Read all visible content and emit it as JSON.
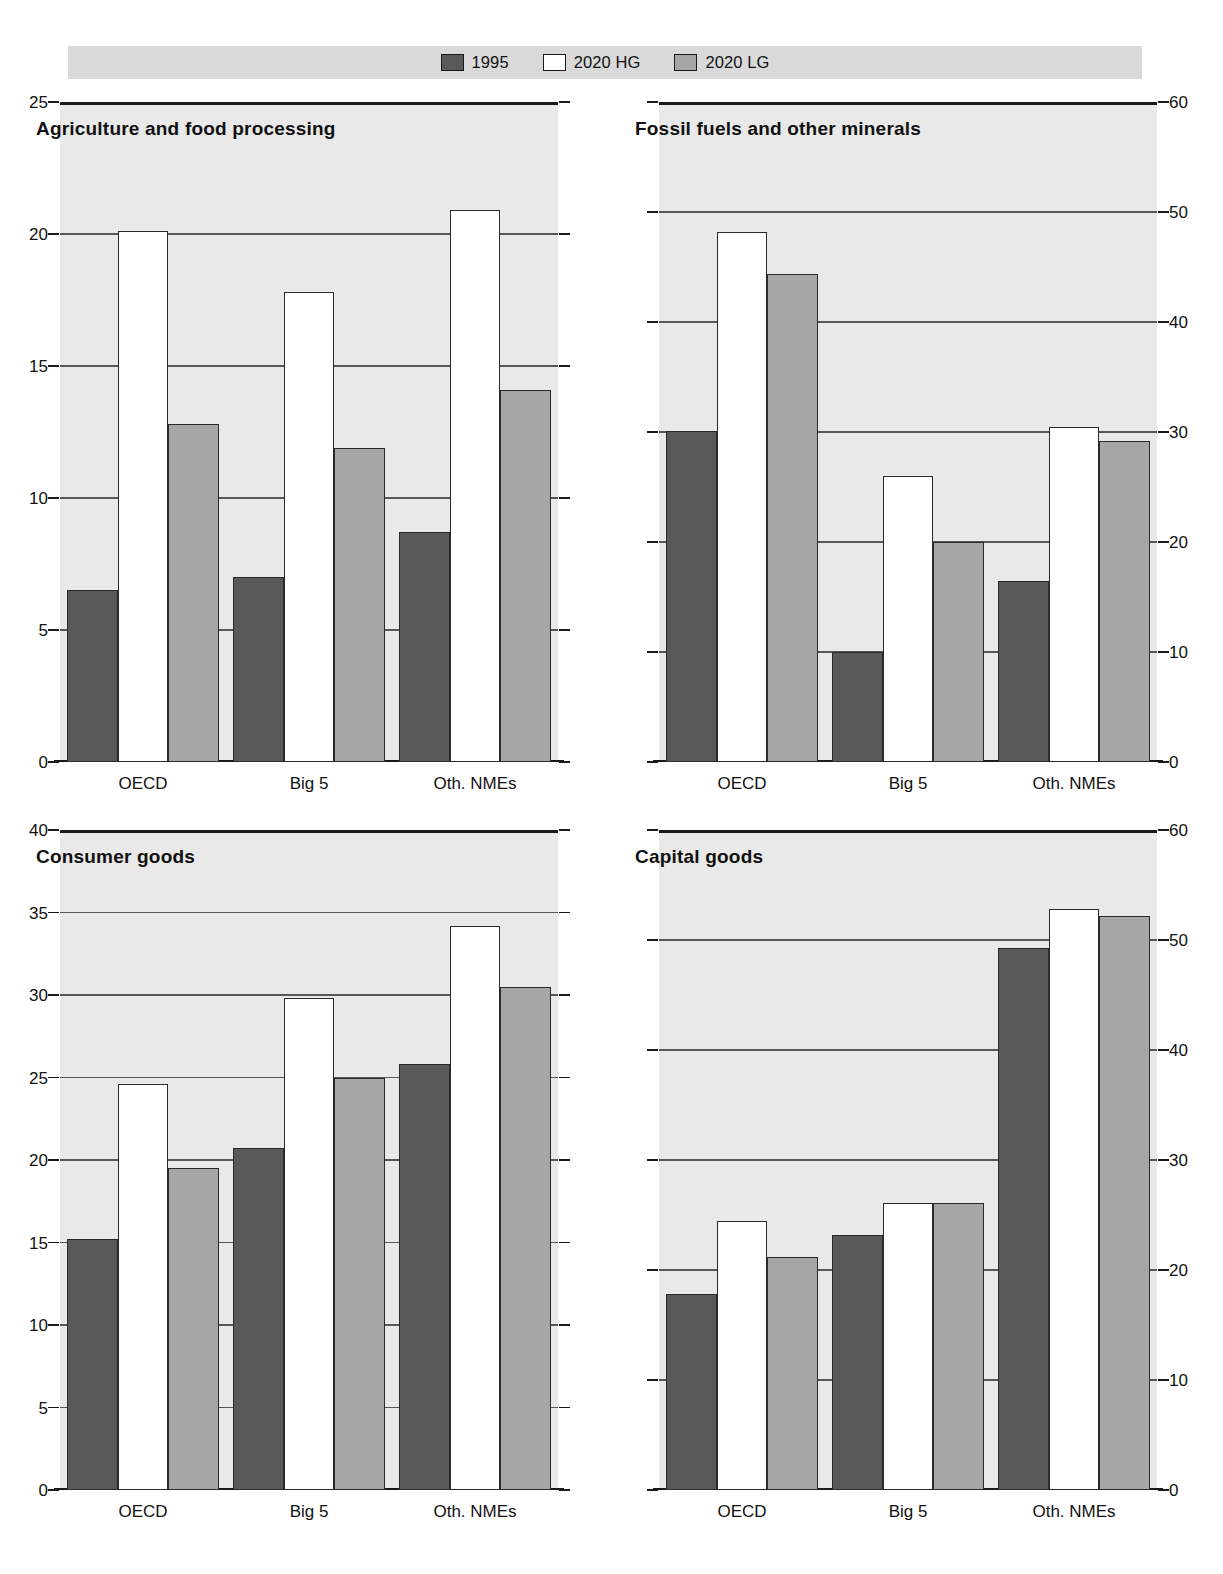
{
  "legend": {
    "entries": [
      {
        "label": "1995",
        "swatch": "dark-gray",
        "color": "#595959"
      },
      {
        "label": "2020 HG",
        "swatch": "white",
        "color": "#ffffff"
      },
      {
        "label": "2020 LG",
        "swatch": "medium-gray",
        "color": "#a6a6a6"
      }
    ]
  },
  "chart_data": [
    {
      "type": "bar",
      "title": "Agriculture and food processing",
      "xlabel": "",
      "ylabel": "",
      "categories": [
        "OECD",
        "Big 5",
        "Oth. NMEs"
      ],
      "series": [
        {
          "name": "1995",
          "values": [
            6.5,
            7.0,
            8.7
          ]
        },
        {
          "name": "2020 HG",
          "values": [
            20.1,
            17.8,
            20.9
          ]
        },
        {
          "name": "2020 LG",
          "values": [
            12.8,
            11.9,
            14.1
          ]
        }
      ],
      "ylim": [
        0,
        25
      ],
      "yticks": [
        0,
        5,
        10,
        15,
        20,
        25
      ],
      "ytick_labels": [
        "0",
        "5",
        "10",
        "15",
        "20",
        "25"
      ],
      "axis_side": "left",
      "grid": true,
      "legend_position": "top"
    },
    {
      "type": "bar",
      "title": "Fossil fuels and other minerals",
      "xlabel": "",
      "ylabel": "",
      "categories": [
        "OECD",
        "Big 5",
        "Oth. NMEs"
      ],
      "series": [
        {
          "name": "1995",
          "values": [
            30.1,
            10.0,
            16.5
          ]
        },
        {
          "name": "2020 HG",
          "values": [
            48.2,
            26.0,
            30.5
          ]
        },
        {
          "name": "2020 LG",
          "values": [
            44.4,
            20.0,
            29.2
          ]
        }
      ],
      "ylim": [
        0,
        60
      ],
      "yticks": [
        0,
        10,
        20,
        30,
        40,
        50,
        60
      ],
      "ytick_labels": [
        "0",
        "10",
        "20",
        "30",
        "40",
        "50",
        "60"
      ],
      "axis_side": "right",
      "grid": true,
      "legend_position": "top"
    },
    {
      "type": "bar",
      "title": "Consumer goods",
      "xlabel": "",
      "ylabel": "",
      "categories": [
        "OECD",
        "Big 5",
        "Oth. NMEs"
      ],
      "series": [
        {
          "name": "1995",
          "values": [
            15.2,
            20.7,
            25.8
          ]
        },
        {
          "name": "2020 HG",
          "values": [
            24.6,
            29.8,
            34.2
          ]
        },
        {
          "name": "2020 LG",
          "values": [
            19.5,
            25.0,
            30.5
          ]
        }
      ],
      "ylim": [
        0,
        40
      ],
      "yticks": [
        0,
        5,
        10,
        15,
        20,
        25,
        30,
        35,
        40
      ],
      "ytick_labels": [
        "0",
        "5",
        "10",
        "15",
        "20",
        "25",
        "30",
        "35",
        "40"
      ],
      "axis_side": "left",
      "grid": true,
      "legend_position": "top"
    },
    {
      "type": "bar",
      "title": "Capital goods",
      "xlabel": "",
      "ylabel": "",
      "categories": [
        "OECD",
        "Big 5",
        "Oth. NMEs"
      ],
      "series": [
        {
          "name": "1995",
          "values": [
            17.8,
            23.2,
            49.3
          ]
        },
        {
          "name": "2020 HG",
          "values": [
            24.5,
            26.1,
            52.8
          ]
        },
        {
          "name": "2020 LG",
          "values": [
            21.2,
            26.1,
            52.2
          ]
        }
      ],
      "ylim": [
        0,
        60
      ],
      "yticks": [
        0,
        10,
        20,
        30,
        40,
        50,
        60
      ],
      "ytick_labels": [
        "0",
        "10",
        "20",
        "30",
        "40",
        "50",
        "60"
      ],
      "axis_side": "right",
      "grid": true,
      "legend_position": "top"
    }
  ],
  "style": {
    "series_colors": [
      "#595959",
      "#ffffff",
      "#a6a6a6"
    ],
    "plot_background": "#e9e9e9",
    "legend_background": "#d9d9d9",
    "axis_color": "#1a1a1a",
    "grid_color": "#55575a"
  }
}
